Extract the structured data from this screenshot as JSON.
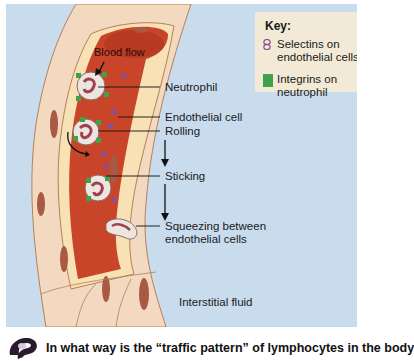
{
  "figure": {
    "labels": {
      "blood_flow": "Blood flow",
      "neutrophil": "Neutrophil",
      "endothelial_cell": "Endothelial cell",
      "rolling": "Rolling",
      "sticking": "Sticking",
      "squeezing_line1": "Squeezing between",
      "squeezing_line2": "endothelial cells",
      "interstitial_fluid": "Interstitial fluid"
    },
    "key": {
      "title": "Key:",
      "items": [
        {
          "line1": "Selectins on",
          "line2": "endothelial cells",
          "icon": "selectin-icon",
          "color": "#8a4f8f"
        },
        {
          "line1": "Integrins on",
          "line2": "neutrophil",
          "icon": "integrin-swatch",
          "color": "#3fa24a"
        }
      ]
    },
    "colors": {
      "background": "#c9dcee",
      "blood": "#c8452a",
      "vessel_wall": "#f3d9bf",
      "nucleus": "#a85a45",
      "integrin": "#3fa24a",
      "selectin": "#8a4f8f"
    }
  },
  "question": {
    "icon": "question-mark-icon",
    "text": "In what way is the “traffic pattern” of lymphocytes in the body"
  }
}
